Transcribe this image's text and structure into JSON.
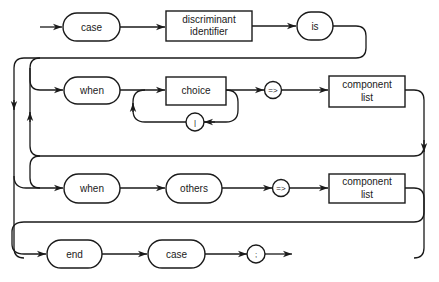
{
  "diagram": {
    "type": "syntax-diagram",
    "rows": [
      {
        "id": "row1",
        "nodes": [
          {
            "kind": "terminal",
            "label": "case"
          },
          {
            "kind": "nonterminal",
            "label_line1": "discriminant",
            "label_line2": "identifier"
          },
          {
            "kind": "terminal",
            "label": "is"
          }
        ]
      },
      {
        "id": "row2",
        "nodes": [
          {
            "kind": "terminal",
            "label": "when"
          },
          {
            "kind": "nonterminal",
            "label": "choice"
          },
          {
            "kind": "symbol",
            "label": "|"
          },
          {
            "kind": "symbol",
            "label": "=>"
          },
          {
            "kind": "nonterminal",
            "label_line1": "component",
            "label_line2": "list"
          }
        ]
      },
      {
        "id": "row3",
        "nodes": [
          {
            "kind": "terminal",
            "label": "when"
          },
          {
            "kind": "terminal",
            "label": "others"
          },
          {
            "kind": "symbol",
            "label": "=>"
          },
          {
            "kind": "nonterminal",
            "label_line1": "component",
            "label_line2": "list"
          }
        ]
      },
      {
        "id": "row4",
        "nodes": [
          {
            "kind": "terminal",
            "label": "end"
          },
          {
            "kind": "terminal",
            "label": "case"
          },
          {
            "kind": "symbol",
            "label": ";"
          }
        ]
      }
    ]
  },
  "style": {
    "stroke_color": "#1a1a1a",
    "background": "#ffffff"
  }
}
